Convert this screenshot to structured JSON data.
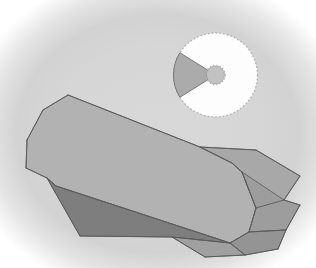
{
  "canvas": {
    "width": 316,
    "height": 268,
    "background_color": "#d6d6d6",
    "vignette_color": "#ffffff",
    "title": "Polyhedron Viewer"
  },
  "palette": {
    "face_light": "#b0b0b0",
    "face_mid": "#a3a3a3",
    "face_medium": "#9b9b9b",
    "face_dark": "#7d7d7d",
    "face_darker": "#737373",
    "edge_color": "#5a5a5a",
    "disc_fill": "#fdfdfd",
    "disc_sector_fill": "#ababab",
    "disc_outline": "#b4b4b4",
    "hub_fill": "#c2c2c2"
  },
  "solid": {
    "name": "faceted-prism",
    "label": "Faceted prism solid",
    "faces": [
      {
        "id": "top-long-face",
        "label": "Top elongated face",
        "fill": "#b2b2b2",
        "points": "68,95 43,110 27,140 26,168 47,178 56,186 230,243 249,232 256,208 242,172 232,163 200,147"
      },
      {
        "id": "lower-left-dark-face",
        "label": "Lower left shadow face",
        "fill": "#7e7e7e",
        "points": "47,178 80,236 172,237 230,243 56,186"
      },
      {
        "id": "right-upper-facet",
        "label": "Right upper facet",
        "fill": "#a8a8a8",
        "points": "200,147 232,163 242,172 256,208 284,200 300,176 256,150"
      },
      {
        "id": "right-mid-facet",
        "label": "Right middle facet",
        "fill": "#9d9d9d",
        "points": "242,172 256,208 249,232 286,230 300,205 284,200"
      },
      {
        "id": "right-lower-facet",
        "label": "Right lower facet",
        "fill": "#949494",
        "points": "230,243 249,232 286,230 278,249 245,255"
      },
      {
        "id": "bottom-right-facet",
        "label": "Bottom right facet",
        "fill": "#a0a0a0",
        "points": "172,237 230,243 245,255 205,257"
      }
    ],
    "edges": [
      {
        "id": "edge-top-ridge",
        "path": "M68,95 L200,147"
      },
      {
        "id": "edge-top-left-a",
        "path": "M68,95 L43,110"
      },
      {
        "id": "edge-top-left-b",
        "path": "M43,110 L27,140"
      },
      {
        "id": "edge-left",
        "path": "M27,140 L26,168"
      },
      {
        "id": "edge-left-lower",
        "path": "M26,168 L47,178"
      },
      {
        "id": "edge-shadow-top",
        "path": "M47,178 L56,186"
      },
      {
        "id": "edge-long-lower",
        "path": "M56,186 L230,243"
      },
      {
        "id": "edge-shadow-left",
        "path": "M47,178 L80,236"
      },
      {
        "id": "edge-shadow-bottom",
        "path": "M80,236 L172,237"
      },
      {
        "id": "edge-shadow-bottom-right",
        "path": "M172,237 L230,243"
      },
      {
        "id": "edge-right-a",
        "path": "M200,147 L232,163"
      },
      {
        "id": "edge-right-b",
        "path": "M232,163 L242,172"
      },
      {
        "id": "edge-right-c",
        "path": "M242,172 L256,208"
      },
      {
        "id": "edge-right-d",
        "path": "M256,208 L249,232"
      },
      {
        "id": "edge-right-e",
        "path": "M249,232 L230,243"
      },
      {
        "id": "edge-facet-top",
        "path": "M200,147 L256,150"
      },
      {
        "id": "edge-facet-right",
        "path": "M256,150 L300,176"
      },
      {
        "id": "edge-facet-right-b",
        "path": "M300,176 L284,200"
      },
      {
        "id": "edge-facet-right-c",
        "path": "M284,200 L256,208"
      },
      {
        "id": "edge-facet-right-d",
        "path": "M284,200 L300,205"
      },
      {
        "id": "edge-facet-right-e",
        "path": "M300,205 L286,230"
      },
      {
        "id": "edge-facet-right-f",
        "path": "M286,230 L249,232"
      },
      {
        "id": "edge-facet-right-g",
        "path": "M286,230 L278,249"
      },
      {
        "id": "edge-facet-right-h",
        "path": "M278,249 L245,255"
      },
      {
        "id": "edge-facet-right-i",
        "path": "M245,255 L230,243"
      },
      {
        "id": "edge-facet-bottom",
        "path": "M245,255 L205,257"
      },
      {
        "id": "edge-facet-bottom-b",
        "path": "M205,257 L172,237"
      }
    ]
  },
  "disc": {
    "name": "sector-disc-inset",
    "label": "Disc sector indicator",
    "center_x": 215.5,
    "center_y": 75,
    "radius": 42,
    "hub_radius": 9,
    "hub_inner_radius": 6.5,
    "sector_start_angle_deg": 148,
    "sector_end_angle_deg": 212,
    "sector_label": "Selected sector",
    "outline_style": "dotted"
  }
}
